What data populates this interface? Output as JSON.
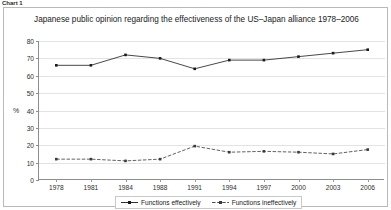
{
  "caption_stub": "Chart 1",
  "chart_data": {
    "type": "line",
    "title": "Japanese public opinion regarding the effectiveness of the US–Japan alliance 1978–2006",
    "xlabel": "",
    "ylabel": "%",
    "categories": [
      "1978",
      "1981",
      "1984",
      "1988",
      "1991",
      "1994",
      "1997",
      "2000",
      "2003",
      "2006"
    ],
    "ylim": [
      0,
      80
    ],
    "ytick_step": 10,
    "yticks": [
      "0",
      "10",
      "20",
      "30",
      "40",
      "50",
      "60",
      "70",
      "80"
    ],
    "grid": true,
    "legend_position": "bottom-center",
    "series": [
      {
        "name": "Functions effectively",
        "style": "solid",
        "color": "#1a1a1a",
        "marker": "square",
        "values": [
          66,
          66,
          72,
          70,
          64,
          69,
          69,
          71,
          73,
          75
        ]
      },
      {
        "name": "Functions ineffectively",
        "style": "dashed",
        "color": "#3a3a3a",
        "marker": "square",
        "values": [
          12,
          12,
          11,
          12,
          19.5,
          16,
          16.5,
          16,
          15,
          17.5
        ]
      }
    ]
  }
}
